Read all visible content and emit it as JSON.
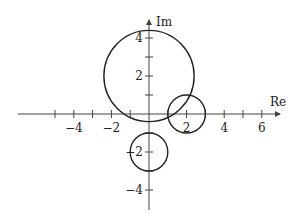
{
  "diagram": {
    "type": "complex-plane",
    "axes": {
      "x_label": "Re",
      "y_label": "Im",
      "x_ticks": [
        -5,
        -4,
        -3,
        -2,
        -1,
        1,
        2,
        3,
        4,
        5,
        6
      ],
      "x_tick_labels": [
        {
          "value": -4,
          "text": "−4"
        },
        {
          "value": -2,
          "text": "−2"
        },
        {
          "value": 2,
          "text": "2"
        },
        {
          "value": 4,
          "text": "4"
        },
        {
          "value": 6,
          "text": "6"
        }
      ],
      "y_ticks": [
        -4,
        -3,
        -2,
        -1,
        1,
        2,
        3,
        4
      ],
      "y_tick_labels": [
        {
          "value": 4,
          "text": "4"
        },
        {
          "value": 2,
          "text": "2"
        },
        {
          "value": -2,
          "text": "−2"
        },
        {
          "value": -4,
          "text": "−4"
        }
      ]
    },
    "circles": [
      {
        "name": "large-circle",
        "center": [
          0,
          2
        ],
        "radius": 2.4
      },
      {
        "name": "right-circle",
        "center": [
          2,
          0
        ],
        "radius": 1
      },
      {
        "name": "lower-circle",
        "center": [
          0,
          -2
        ],
        "radius": 1
      }
    ]
  }
}
